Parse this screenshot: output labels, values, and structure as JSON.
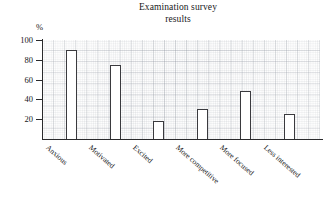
{
  "chart_data": {
    "type": "bar",
    "title": "Examination survey results",
    "title_line1": "Examination survey",
    "title_line2": "results",
    "xlabel": "",
    "ylabel": "%",
    "categories": [
      "Anxious",
      "Motivated",
      "Excited",
      "More competitive",
      "More focused",
      "Less interested"
    ],
    "values": [
      90,
      75,
      18,
      30,
      48,
      25
    ],
    "ylim": [
      0,
      100
    ],
    "yticks": [
      20,
      40,
      60,
      80,
      100
    ],
    "ytick_labels": [
      "20",
      "40",
      "60",
      "80",
      "100"
    ],
    "grid": true,
    "grid_style": "graph-paper",
    "legend": "none",
    "bar_fill": "#ffffff",
    "bar_outline": "#3a3a3e",
    "axis_color": "#2a2a2c"
  }
}
